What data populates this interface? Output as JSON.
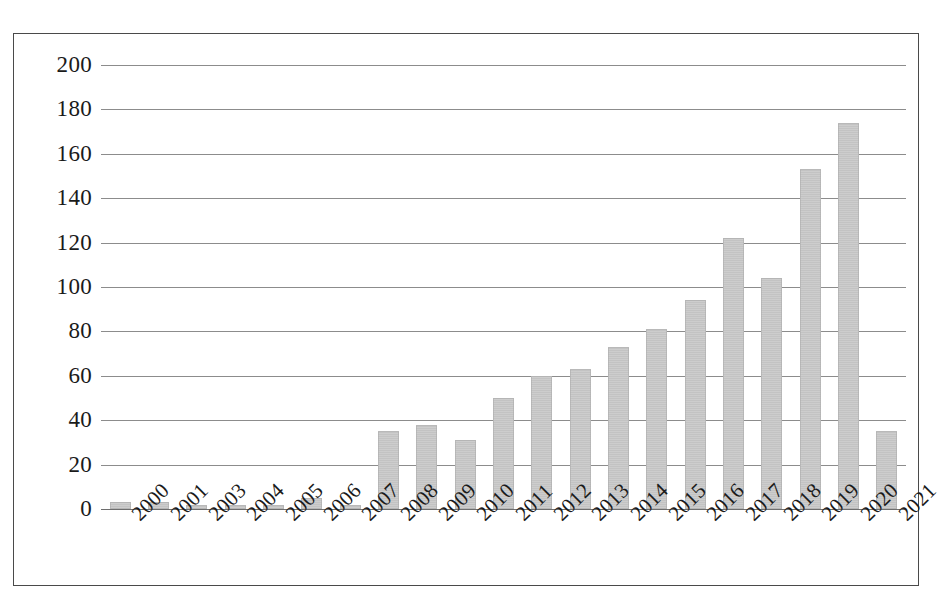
{
  "chart_data": {
    "type": "bar",
    "title": "",
    "subtitle": "",
    "xlabel": "",
    "ylabel": "",
    "categories": [
      "2000",
      "2001",
      "2003",
      "2004",
      "2005",
      "2006",
      "2007",
      "2008",
      "2009",
      "2010",
      "2011",
      "2012",
      "2013",
      "2014",
      "2015",
      "2016",
      "2017",
      "2018",
      "2019",
      "2020",
      "2021"
    ],
    "values": [
      3,
      3,
      2,
      2,
      2,
      5,
      2,
      35,
      38,
      31,
      50,
      60,
      63,
      73,
      81,
      94,
      122,
      104,
      153,
      174,
      35
    ],
    "series": [
      {
        "name": "Publications",
        "values": [
          3,
          3,
          2,
          2,
          2,
          5,
          2,
          35,
          38,
          31,
          50,
          60,
          63,
          73,
          81,
          94,
          122,
          104,
          153,
          174,
          35
        ]
      }
    ],
    "ylim": [
      0,
      200
    ],
    "ytick_step": 20,
    "yticks": [
      200,
      180,
      160,
      140,
      120,
      100,
      80,
      60,
      40,
      20,
      0
    ],
    "ytick_labels": [
      "200",
      "180",
      "160",
      "140",
      "120",
      "100",
      "80",
      "60",
      "40",
      "20",
      "0"
    ],
    "grid": "horizontal",
    "legend": "none",
    "bar_color": "#cacaca",
    "gridline_color": "#8c8c8c",
    "axis_text_color": "#1a1a1a",
    "frame_color": "#4a4a4a",
    "background": "#ffffff",
    "xtick_rotation": "-45"
  }
}
